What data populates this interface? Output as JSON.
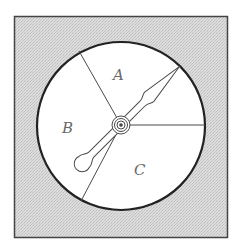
{
  "diagram": {
    "type": "spinner",
    "sections": [
      {
        "label": "A"
      },
      {
        "label": "B"
      },
      {
        "label": "C"
      }
    ],
    "colors": {
      "background_panel": "#d6d6d6",
      "border": "#333333",
      "dial_face": "#ffffff",
      "lines": "#444444",
      "label_text": "#6a6a6a"
    }
  }
}
